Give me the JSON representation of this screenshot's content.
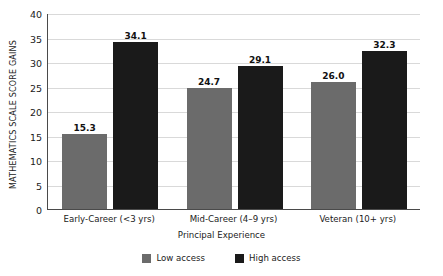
{
  "chart_data": {
    "type": "bar",
    "title": "",
    "xlabel": "Principal Experience",
    "ylabel": "MATHEMATICS SCALE SCORE GAINS",
    "categories": [
      "Early-Career (<3 yrs)",
      "Mid-Career (4–9 yrs)",
      "Veteran (10+ yrs)"
    ],
    "series": [
      {
        "name": "Low access",
        "color": "#6b6b6b",
        "values": [
          15.3,
          24.7,
          26.0
        ],
        "labels": [
          "15.3",
          "24.7",
          "26.0"
        ]
      },
      {
        "name": "High access",
        "color": "#1a1a1a",
        "values": [
          34.1,
          29.1,
          32.3
        ],
        "labels": [
          "34.1",
          "29.1",
          "32.3"
        ]
      }
    ],
    "ylim": [
      0,
      40
    ],
    "yticks": [
      "0",
      "5",
      "10",
      "15",
      "20",
      "25",
      "30",
      "35",
      "40"
    ],
    "ytick_values": [
      0,
      5,
      10,
      15,
      20,
      25,
      30,
      35,
      40
    ],
    "grid": "horizontal",
    "legend_position": "bottom-center",
    "background": "#ffffff",
    "axis_color": "#4a4a4a",
    "grid_color": "#d9d9d9"
  }
}
